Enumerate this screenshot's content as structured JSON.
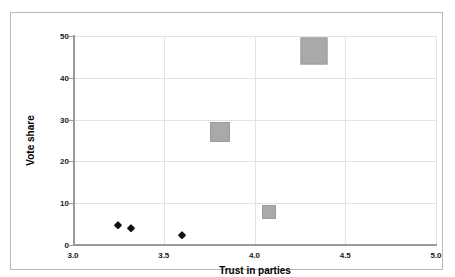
{
  "figure": {
    "top_sliver_text": "",
    "frame_color": "#b9b9b9",
    "background": "#ffffff"
  },
  "chart_data": {
    "type": "scatter",
    "title": "",
    "xlabel": "Trust in parties",
    "ylabel": "Vote share",
    "xlim": [
      3.0,
      5.0
    ],
    "ylim": [
      0,
      50
    ],
    "xticks": [
      3.0,
      3.5,
      4.0,
      4.5,
      5.0
    ],
    "xtick_labels": [
      "3.0",
      "3.5",
      "4.0",
      "4.5",
      "5.0"
    ],
    "yticks": [
      0,
      10,
      20,
      30,
      40,
      50
    ],
    "ytick_labels": [
      "0",
      "10",
      "20",
      "30",
      "40",
      "50"
    ],
    "grid": true,
    "grid_color": "#e3e3e3",
    "axis_color": "#9a9a9a",
    "legend": null,
    "series": [
      {
        "name": "small-parties",
        "marker": "diamond",
        "color": "#111111",
        "points": [
          {
            "x": 3.25,
            "y": 4.8,
            "size": 8
          },
          {
            "x": 3.32,
            "y": 4.0,
            "size": 8
          },
          {
            "x": 3.6,
            "y": 2.5,
            "size": 8
          }
        ]
      },
      {
        "name": "large-parties",
        "marker": "square",
        "color": "#a9a9a9",
        "points": [
          {
            "x": 4.08,
            "y": 8.0,
            "size": 14
          },
          {
            "x": 3.81,
            "y": 27.0,
            "size": 20
          },
          {
            "x": 4.33,
            "y": 46.5,
            "size": 27
          }
        ]
      }
    ]
  }
}
